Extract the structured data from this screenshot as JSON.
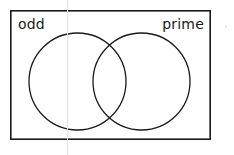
{
  "figure": {
    "type": "venn-diagram-2-set",
    "title": "",
    "background_color": "#ffffff",
    "stroke_color": "#1a1a1a",
    "text_color": "#1a1a1a"
  },
  "universe": {
    "name": "universal-set-rectangle",
    "label": "",
    "x": 10,
    "y": 10,
    "width": 201,
    "height": 130,
    "stroke_width": 1.6
  },
  "sets": [
    {
      "id": "odd",
      "label": "odd",
      "label_position": "top-left",
      "circle": {
        "cx": 77.5,
        "cy": 81.5,
        "r": 48.5
      },
      "stroke_width": 1.3,
      "fill": "none"
    },
    {
      "id": "prime",
      "label": "prime",
      "label_position": "top-right",
      "circle": {
        "cx": 141.5,
        "cy": 81.5,
        "r": 48.5
      },
      "stroke_width": 1.3,
      "fill": "none"
    }
  ],
  "regions": {
    "odd_only": "",
    "intersection": "",
    "prime_only": "",
    "outside": ""
  },
  "artifacts": {
    "fold_line": {
      "x": 67,
      "color": "#e3e3e3"
    },
    "speck": {
      "x": 225,
      "y": 25,
      "color": "#e8e8e8"
    }
  }
}
